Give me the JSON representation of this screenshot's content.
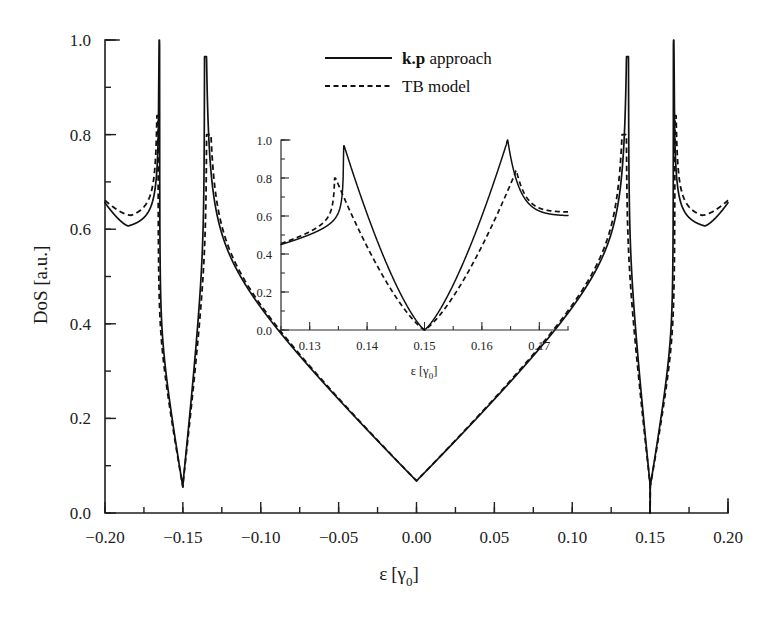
{
  "chart_data": {
    "type": "line",
    "title": "",
    "xlabel": "ε [γ0]",
    "ylabel": "DoS [a.u.]",
    "xlim": [
      -0.2,
      0.2
    ],
    "ylim": [
      0.0,
      1.0
    ],
    "xticks": [
      -0.2,
      -0.15,
      -0.1,
      -0.05,
      0.0,
      0.05,
      0.1,
      0.15,
      0.2
    ],
    "xtick_labels": [
      "−0.20",
      "−0.15",
      "−0.10",
      "−0.05",
      "0.00",
      "0.05",
      "0.10",
      "0.15",
      "0.20"
    ],
    "yticks": [
      0.0,
      0.2,
      0.4,
      0.6,
      0.8,
      1.0
    ],
    "ytick_labels": [
      "0.0",
      "0.2",
      "0.4",
      "0.6",
      "0.8",
      "1.0"
    ],
    "xminor_step": 0.025,
    "yminor_step": 0.1,
    "grid": false,
    "legend_position": "top-center-right",
    "legend": [
      {
        "name": "k.p approach",
        "name_bold_prefix": "k.p",
        "name_rest": " approach",
        "style": "solid"
      },
      {
        "name": "TB model",
        "name_bold_prefix": "",
        "name_rest": "TB model",
        "style": "dashed"
      }
    ],
    "series": [
      {
        "name": "k.p approach",
        "style": "solid",
        "description": "Density of states of a semiconducting carbon nanotube: van Hove singularities at subband edges, linear V-shaped minimum at zero energy.",
        "van_hove_edges": [
          -0.165,
          -0.136,
          0.136,
          0.165
        ],
        "peak_values": [
          1.0,
          0.965,
          0.965,
          1.0
        ],
        "zero_points": [
          -0.15,
          0.0,
          0.15
        ],
        "edge_values": {
          "x_-0.20": 0.64,
          "x_0.20": 0.64
        },
        "local_minima": [
          {
            "x": -0.185,
            "y": 0.585
          },
          {
            "x": 0.185,
            "y": 0.585
          }
        ]
      },
      {
        "name": "TB model",
        "style": "dashed",
        "description": "Tight-binding DoS: singularities slightly shifted outward/inward relative to k.p, peaks lower on the outer flank.",
        "van_hove_edges": [
          -0.166,
          -0.1345,
          0.1345,
          0.166
        ],
        "peak_values": [
          0.84,
          0.8,
          0.8,
          0.84
        ],
        "zero_points": [
          -0.15,
          0.0,
          0.15
        ],
        "edge_values": {
          "x_-0.20": 0.645,
          "x_0.20": 0.645
        },
        "local_minima": [
          {
            "x": -0.183,
            "y": 0.605
          },
          {
            "x": 0.183,
            "y": 0.605
          }
        ]
      }
    ],
    "inset": {
      "type": "line",
      "xlabel": "ε [γ0]",
      "ylabel": "",
      "xlim": [
        0.125,
        0.175
      ],
      "ylim": [
        0.0,
        1.0
      ],
      "xticks": [
        0.13,
        0.14,
        0.15,
        0.16,
        0.17
      ],
      "xtick_labels": [
        "0.13",
        "0.14",
        "0.15",
        "0.16",
        "0.17"
      ],
      "yticks": [
        0.0,
        0.2,
        0.4,
        0.6,
        0.8,
        1.0
      ],
      "ytick_labels": [
        "0.0",
        "0.2",
        "0.4",
        "0.6",
        "0.8",
        "1.0"
      ],
      "xminor_step": 0.005,
      "yminor_step": 0.1,
      "grid": false,
      "series": [
        {
          "name": "k.p approach",
          "style": "solid",
          "van_hove_edges": [
            0.136,
            0.1645
          ],
          "peak_values": [
            0.97,
            1.0
          ],
          "zero_points": [
            0.15
          ],
          "edge_values": {
            "x_0.125": 0.45,
            "x_0.175": 0.6
          }
        },
        {
          "name": "TB model",
          "style": "dashed",
          "van_hove_edges": [
            0.1345,
            0.166
          ],
          "peak_values": [
            0.8,
            0.84
          ],
          "zero_points": [
            0.15
          ],
          "edge_values": {
            "x_0.125": 0.455,
            "x_0.175": 0.62
          }
        }
      ]
    },
    "colors": {
      "curve": "#111111",
      "axis": "#1f1f1f",
      "background": "#ffffff",
      "text": "#1a1a1a"
    }
  }
}
